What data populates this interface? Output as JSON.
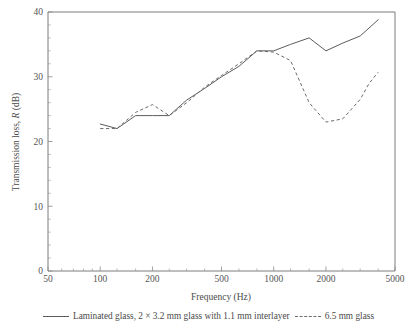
{
  "chart_data": {
    "type": "line",
    "title": "",
    "xlabel": "Frequency (Hz)",
    "ylabel": "Transmission loss, R (dB)",
    "ylabel_prefix": "Transmission loss, ",
    "ylabel_symbol": "R",
    "ylabel_suffix": " (dB)",
    "xscale": "log",
    "yscale": "linear",
    "xlim": [
      50,
      5000
    ],
    "ylim": [
      0,
      40
    ],
    "grid": false,
    "legend_position": "below",
    "xticks": [
      50,
      100,
      200,
      500,
      1000,
      2000,
      5000
    ],
    "xticklabels": [
      "50",
      "100",
      "200",
      "500",
      "1000",
      "2000",
      "5000"
    ],
    "yticks": [
      0,
      10,
      20,
      30,
      40
    ],
    "yticklabels": [
      "0",
      "10",
      "20",
      "30",
      "40"
    ],
    "yticks_minor": [
      2,
      4,
      6,
      8,
      12,
      14,
      16,
      18,
      22,
      24,
      26,
      28,
      32,
      34,
      36,
      38
    ],
    "xticks_minor": [
      60,
      70,
      80,
      90,
      125,
      160,
      250,
      315,
      400,
      630,
      800,
      1250,
      1600,
      2500,
      3150,
      4000
    ],
    "series": [
      {
        "name": "Laminated glass, 2 × 3.2 mm glass with 1.1 mm interlayer",
        "style": "solid",
        "color": "#5c5c5c",
        "x": [
          100,
          125,
          160,
          200,
          250,
          315,
          400,
          500,
          630,
          800,
          1000,
          1250,
          1600,
          2000,
          2500,
          3150,
          4000
        ],
        "y": [
          22.7,
          22.0,
          24.0,
          24.0,
          24.0,
          26.4,
          28.2,
          30.0,
          31.6,
          34.0,
          34.0,
          35.0,
          36.0,
          34.0,
          35.2,
          36.3,
          38.8
        ]
      },
      {
        "name": "6.5 mm glass",
        "style": "dashed",
        "color": "#6a6a6a",
        "x": [
          100,
          125,
          160,
          200,
          250,
          315,
          400,
          500,
          630,
          800,
          1000,
          1250,
          1600,
          2000,
          2500,
          3150,
          3550,
          4000
        ],
        "y": [
          22.0,
          22.0,
          24.5,
          25.7,
          24.0,
          26.0,
          28.4,
          30.2,
          32.0,
          34.0,
          33.8,
          32.5,
          26.0,
          23.0,
          23.5,
          26.5,
          29.0,
          30.7
        ]
      }
    ]
  },
  "legend": {
    "entries": [
      {
        "label_prefix": "Laminated glass, 2 × 3.2 mm glass with 1.1 mm interlayer",
        "style": "solid"
      },
      {
        "label_prefix": "6.5 mm glass",
        "style": "dashed"
      }
    ]
  }
}
